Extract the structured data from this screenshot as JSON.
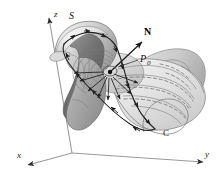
{
  "figure": {
    "kind": "3d-surface-diagram",
    "width": 223,
    "height": 177,
    "background_color": "#ffffff"
  },
  "axes": {
    "origin": {
      "x": 72,
      "y": 153
    },
    "items": [
      {
        "name": "x",
        "label": "x",
        "label_x": 17,
        "label_y": 158,
        "line": {
          "x1": 72,
          "y1": 153,
          "x2": 26,
          "y2": 166
        },
        "arrow_angle_deg": 164
      },
      {
        "name": "y",
        "label": "y",
        "label_x": 205,
        "label_y": 157,
        "line": {
          "x1": 72,
          "y1": 153,
          "x2": 206,
          "y2": 163
        },
        "arrow_angle_deg": 4
      },
      {
        "name": "z",
        "label": "z",
        "label_x": 54,
        "label_y": 17,
        "line": {
          "x1": 72,
          "y1": 153,
          "x2": 48,
          "y2": 13
        },
        "arrow_angle_deg": -99
      }
    ],
    "axis_color": "#8c8c8c",
    "arrow_color": "#2a2a2a"
  },
  "labels": {
    "surface": "S",
    "normal_vector": "N",
    "point": "P",
    "point_subscript": "0",
    "curve": "C"
  },
  "annotations": [
    {
      "id": "surface-label",
      "text": "S",
      "x": 72,
      "y": 18,
      "describes": "the oriented surface"
    },
    {
      "id": "normal-label",
      "text": "N",
      "x": 145,
      "y": 35,
      "describes": "unit normal vector at P0"
    },
    {
      "id": "point-label",
      "text": "P0",
      "x": 142,
      "y": 62,
      "describes": "base point of the normal vector"
    },
    {
      "id": "curve-label",
      "text": "C",
      "x": 165,
      "y": 134,
      "describes": "boundary curve of S, positively oriented"
    }
  ],
  "normal_vector": {
    "tail_x": 110,
    "tail_y": 72,
    "head_x": 143,
    "head_y": 41,
    "color": "#1a1a1a"
  },
  "point_marker": {
    "x": 110,
    "y": 72,
    "radius": 2.2,
    "halo_radius": 6.5,
    "color": "#111111"
  },
  "leader_line": {
    "x1": 138,
    "y1": 60,
    "x2": 117,
    "y2": 68
  },
  "colors": {
    "surface_light": "#e8e8e8",
    "surface_mid": "#cfcfcf",
    "surface_dark": "#8f8f8f",
    "surface_darker": "#6b6b6b",
    "surface_edge": "#4a4a4a",
    "curve_stroke": "#2b2b2b",
    "dashed_stroke": "#6a6a6a",
    "flow_line": "#707070"
  },
  "curve_c": {
    "description": "Boundary curve C traversed counterclockwise as seen from the normal side",
    "arrow_count": 14,
    "stroke_width": 1.1
  },
  "flow_arrows": {
    "description": "Arrows radiating from P0 along the surface indicating circulation",
    "count": 8
  }
}
